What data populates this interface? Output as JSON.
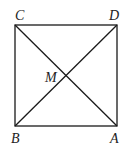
{
  "diagram": {
    "type": "square-with-diagonals",
    "stroke_color": "#1a1a1a",
    "points": {
      "C": {
        "label": "C",
        "x": 15,
        "y": 25
      },
      "D": {
        "label": "D",
        "x": 117,
        "y": 25
      },
      "B": {
        "label": "B",
        "x": 15,
        "y": 126
      },
      "A": {
        "label": "A",
        "x": 117,
        "y": 126
      },
      "M": {
        "label": "M",
        "x": 66,
        "y": 75.5
      }
    },
    "labels": {
      "C": "C",
      "D": "D",
      "M": "M",
      "B": "B",
      "A": "A"
    },
    "segments": [
      [
        "C",
        "D"
      ],
      [
        "D",
        "A"
      ],
      [
        "A",
        "B"
      ],
      [
        "B",
        "C"
      ],
      [
        "C",
        "A"
      ],
      [
        "B",
        "D"
      ]
    ]
  }
}
